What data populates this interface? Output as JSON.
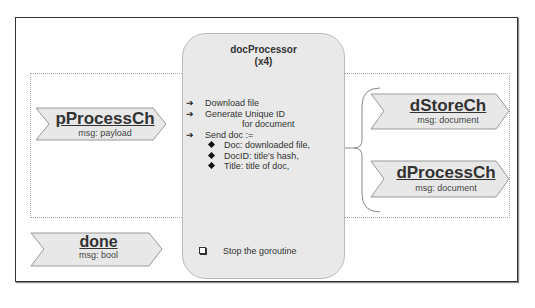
{
  "processor": {
    "title": "docProcessor",
    "count": "(x4)",
    "steps": [
      {
        "arrow": "➔",
        "text": "Download file"
      },
      {
        "arrow": "➔",
        "text": "Generate Unique ID"
      },
      {
        "arrow": "",
        "text": "for document"
      },
      {
        "arrow": "➔",
        "text": "Send doc :="
      }
    ],
    "doc_fields": [
      "Doc: downloaded file,",
      "DocID: title's hash,",
      "Title: title of doc,"
    ],
    "stop_text": "Stop the goroutine"
  },
  "channels": {
    "pProcessCh": {
      "name": "pProcessCh",
      "msg": "msg: payload"
    },
    "dStoreCh": {
      "name": "dStoreCh",
      "msg": "msg: document"
    },
    "dProcessCh": {
      "name": "dProcessCh",
      "msg": "msg: document"
    },
    "done": {
      "name": "done",
      "msg": "msg: bool"
    }
  },
  "icons": {
    "step_arrow": "arrow-right-icon",
    "bullet": "diamond-bullet-icon",
    "stop_bullet": "checkbox-icon"
  }
}
